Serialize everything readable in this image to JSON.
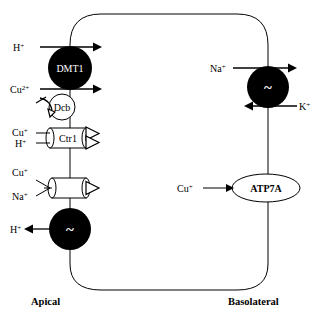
{
  "figure": {
    "background_color": "#ffffff",
    "line_color": "#000000",
    "fill_dark": "#000000",
    "fill_light": "#ffffff"
  },
  "membrane_labels": {
    "apical": "Apical",
    "basolateral": "Basolateral"
  },
  "apical_side": {
    "transporters": [
      {
        "id": "dmt1",
        "name": "DMT1",
        "shape": "filled-circle",
        "label_color": "#ffffff",
        "substrates_in": [
          "H+",
          "Cu2+"
        ],
        "substrate_labels": [
          "H",
          "Cu"
        ],
        "superscripts": [
          "+",
          "2+"
        ]
      },
      {
        "id": "dcb",
        "name": "Dcb",
        "shape": "open-circle",
        "label_color": "#000000"
      },
      {
        "id": "ctr1",
        "name": "Ctr1",
        "shape": "open-cylinder",
        "label_color": "#000000",
        "substrate_labels": [
          "Cu",
          "H"
        ],
        "superscripts": [
          "+",
          "+"
        ]
      },
      {
        "id": "unnamed-cotransporter",
        "name": "",
        "shape": "open-cylinder",
        "label_color": "#000000",
        "substrate_labels": [
          "Cu",
          "Na"
        ],
        "superscripts": [
          "+",
          "+"
        ]
      },
      {
        "id": "proton-pump",
        "name": "~",
        "shape": "filled-circle",
        "label_color": "#ffffff",
        "substrate_labels": [
          "H"
        ],
        "superscripts": [
          "+"
        ]
      }
    ],
    "ion_labels": [
      {
        "id": "h-top",
        "base": "H",
        "sup": "+"
      },
      {
        "id": "cu2",
        "base": "Cu",
        "sup": "2+"
      },
      {
        "id": "cu-ctr1",
        "base": "Cu",
        "sup": "+"
      },
      {
        "id": "h-ctr1",
        "base": "H",
        "sup": "+"
      },
      {
        "id": "cu-cotrans",
        "base": "Cu",
        "sup": "+"
      },
      {
        "id": "na-cotrans",
        "base": "Na",
        "sup": "+"
      },
      {
        "id": "h-pump",
        "base": "H",
        "sup": "+"
      }
    ]
  },
  "basolateral_side": {
    "transporters": [
      {
        "id": "na-k-atpase",
        "name": "~",
        "shape": "filled-circle",
        "label_color": "#ffffff",
        "substrate_labels": [
          "Na",
          "K"
        ],
        "superscripts": [
          "+",
          "+"
        ]
      },
      {
        "id": "atp7a",
        "name": "ATP7A",
        "shape": "open-ellipse",
        "label_color": "#000000",
        "substrate_labels": [
          "Cu"
        ],
        "superscripts": [
          "+"
        ]
      }
    ],
    "ion_labels": [
      {
        "id": "na-pump",
        "base": "Na",
        "sup": "+"
      },
      {
        "id": "k-pump",
        "base": "K",
        "sup": "+"
      },
      {
        "id": "cu-atp7a",
        "base": "Cu",
        "sup": "+"
      }
    ]
  },
  "icons": {
    "arrow_right": "arrow-right-icon",
    "arrow_left": "arrow-left-icon",
    "tilde": "tilde-icon",
    "chevron": "chevron-right-icon"
  }
}
